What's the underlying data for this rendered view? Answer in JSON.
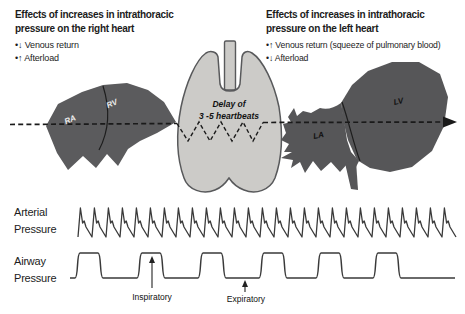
{
  "colors": {
    "heart_right_fill": "#5b5b5d",
    "heart_left_fill": "#565658",
    "lung_fill": "#cccbc8",
    "lung_stroke": "#58595b",
    "trace_stroke": "#3a3a3a",
    "dash_stroke": "#1a1a1a",
    "chamber_text_light": "#ececec",
    "chamber_text_dark": "#111111"
  },
  "panels": {
    "right_heart": {
      "title_line1": "Effects of increases in intrathoracic",
      "title_line2": "pressure on the right heart",
      "bullet1": "•↓ Venous return",
      "bullet2": "•↑ Afterload"
    },
    "left_heart": {
      "title_line1": "Effects of increases in intrathoracic",
      "title_line2": "pressure on the left heart",
      "bullet1": "•↑ Venous return (squeeze of pulmonary blood)",
      "bullet2": "•↓ Afterload"
    }
  },
  "diagram": {
    "ra_label": "RA",
    "rv_label": "RV",
    "la_label": "LA",
    "lv_label": "LV",
    "delay_line1": "Delay of",
    "delay_line2": "3 -5 heartbeats"
  },
  "traces": {
    "arterial_label_line1": "Arterial",
    "arterial_label_line2": "Pressure",
    "airway_label_line1": "Airway",
    "airway_label_line2": "Pressure",
    "inspiratory_label": "Inspiratory",
    "expiratory_label": "Expiratory"
  },
  "waveforms": {
    "arterial": {
      "x0": 78,
      "beats": 27,
      "period": 14,
      "baseline_y": 237,
      "peak_y": 208,
      "notch_y": 227,
      "notch_peak_y": 221
    },
    "airway": {
      "starts": [
        75,
        137,
        198,
        259,
        316,
        373
      ],
      "plateau_width": 28,
      "lead_x": 70,
      "end_x": 455,
      "baseline_y": 278,
      "top_y": 253
    }
  }
}
